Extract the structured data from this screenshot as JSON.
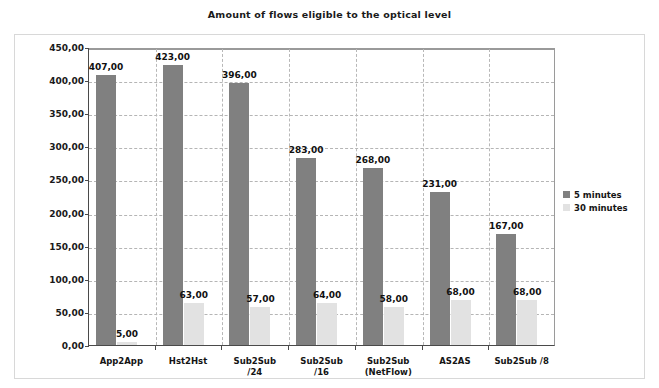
{
  "chart_data": {
    "type": "bar",
    "title": "Amount of flows eligible to the optical level",
    "xlabel": "",
    "ylabel": "",
    "ylim": [
      0,
      450
    ],
    "ytick_step": 50,
    "grid": true,
    "legend_position": "right",
    "categories": [
      "App2App",
      "Hst2Hst",
      "Sub2Sub\n/24",
      "Sub2Sub\n/16",
      "Sub2Sub\n(NetFlow)",
      "AS2AS",
      "Sub2Sub /8"
    ],
    "category_lines": [
      [
        "App2App",
        ""
      ],
      [
        "Hst2Hst",
        ""
      ],
      [
        "Sub2Sub",
        "/24"
      ],
      [
        "Sub2Sub",
        "/16"
      ],
      [
        "Sub2Sub",
        "(NetFlow)"
      ],
      [
        "AS2AS",
        ""
      ],
      [
        "Sub2Sub /8",
        ""
      ]
    ],
    "ytick_labels": [
      "0,00",
      "50,00",
      "100,00",
      "150,00",
      "200,00",
      "250,00",
      "300,00",
      "350,00",
      "400,00",
      "450,00"
    ],
    "ytick_values": [
      0,
      50,
      100,
      150,
      200,
      250,
      300,
      350,
      400,
      450
    ],
    "series": [
      {
        "name": "5 minutes",
        "color": "#808080",
        "values": [
          407,
          423,
          396,
          283,
          268,
          231,
          167
        ],
        "labels": [
          "407,00",
          "423,00",
          "396,00",
          "283,00",
          "268,00",
          "231,00",
          "167,00"
        ]
      },
      {
        "name": "30 minutes",
        "color": "#e2e2e2",
        "values": [
          5,
          63,
          57,
          64,
          58,
          68,
          68
        ],
        "labels": [
          "5,00",
          "63,00",
          "57,00",
          "64,00",
          "58,00",
          "68,00",
          "68,00"
        ]
      }
    ]
  },
  "legend": {
    "items": [
      {
        "label": "5 minutes",
        "color": "#808080"
      },
      {
        "label": "30 minutes",
        "color": "#e2e2e2"
      }
    ]
  }
}
